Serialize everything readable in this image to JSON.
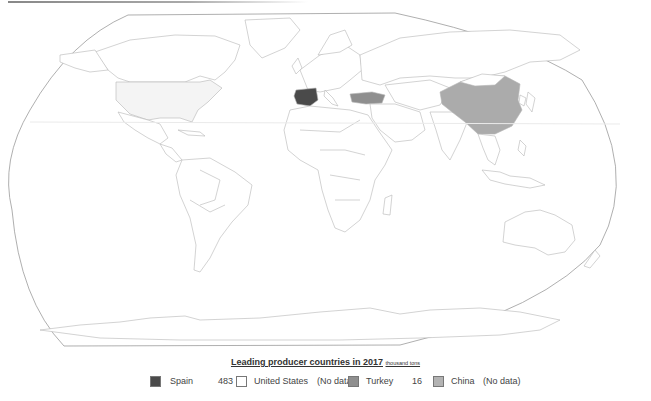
{
  "legend": {
    "title": "Leading producer countries in 2017",
    "unit": "thousand tons",
    "items": [
      {
        "country": "Spain",
        "value": "483",
        "color": "#4a4a4a"
      },
      {
        "country": "United States",
        "value": "(No data)",
        "color": "#ffffff"
      },
      {
        "country": "Turkey",
        "value": "16",
        "color": "#8f8f8f"
      },
      {
        "country": "China",
        "value": "(No data)",
        "color": "#b3b3b3"
      }
    ]
  },
  "map": {
    "projection": "robinson-like",
    "highlighted": [
      {
        "country": "Spain",
        "fill": "#4a4a4a"
      },
      {
        "country": "Turkey",
        "fill": "#8f8f8f"
      },
      {
        "country": "China",
        "fill": "#ababab"
      },
      {
        "country": "United States",
        "fill": "#f4f4f4"
      }
    ],
    "border_color": "#b5b5b5",
    "outline_color": "#9a9a9a"
  }
}
